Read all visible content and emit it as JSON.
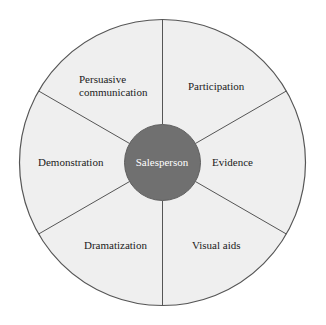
{
  "diagram": {
    "type": "radial-wheel",
    "hub": {
      "label": "Salesperson",
      "fill_color": "#707070",
      "text_color": "#ffffff",
      "radius": 38
    },
    "wheel": {
      "fill_color": "#efefef",
      "stroke_color": "#555555",
      "radius": 143,
      "center_x": 162.5,
      "center_y": 162.5,
      "sector_count": 6
    },
    "background_color": "#ffffff",
    "sectors": [
      {
        "label": "Participation",
        "position": "upper-right"
      },
      {
        "label": "Evidence",
        "position": "right"
      },
      {
        "label": "Visual aids",
        "position": "lower-right"
      },
      {
        "label": "Dramatization",
        "position": "lower-left"
      },
      {
        "label": "Demonstration",
        "position": "left"
      },
      {
        "label": "Persuasive\ncommunication",
        "position": "upper-left"
      }
    ]
  }
}
